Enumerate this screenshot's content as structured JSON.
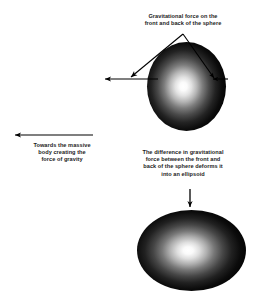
{
  "figure": {
    "background_color": "#ffffff",
    "text_color": "#1c1c1c",
    "body_fill_center_color": "#ffffff",
    "body_fill_edge_color": "#000000"
  },
  "captions": {
    "top": "Gravitational force on the\nfront and back of the sphere",
    "left": "Towards the massive\nbody creating the\nforce of gravity",
    "middle": "The difference in gravitational\nforce between the front and\nback of the sphere deforms it\ninto an ellipsoid"
  },
  "shapes": {
    "sphere": {
      "label": "sphere",
      "cx": 186.5,
      "cy": 86.5,
      "rx": 39.5,
      "ry": 44.5,
      "highlight_cx": 184,
      "highlight_cy": 86
    },
    "ellipsoid": {
      "label": "ellipsoid",
      "cx": 191.5,
      "cy": 250.5,
      "rx": 54.5,
      "ry": 40.5,
      "highlight_cx": 188,
      "highlight_cy": 250
    }
  },
  "arrows": {
    "front_force": {
      "label": "gravitational force on front of sphere",
      "from_x": 158,
      "from_y": 79,
      "to_x": 105,
      "to_y": 79,
      "direction": "left"
    },
    "back_force": {
      "label": "gravitational force on back of sphere",
      "from_x": 228,
      "from_y": 79,
      "to_x": 212,
      "to_y": 79,
      "direction": "left"
    },
    "towards_massive_body": {
      "label": "towards the massive body",
      "from_x": 93,
      "from_y": 135,
      "to_x": 15,
      "to_y": 135,
      "direction": "left"
    },
    "deformation": {
      "label": "deformation result",
      "from_x": 190,
      "from_y": 189,
      "to_x": 190,
      "to_y": 207,
      "direction": "down"
    }
  },
  "leader_lines": {
    "apex_x": 183,
    "apex_y": 34,
    "left_tip_x": 131,
    "left_tip_y": 77,
    "right_tip_x": 214,
    "right_tip_y": 78
  }
}
